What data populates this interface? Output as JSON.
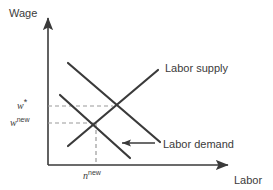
{
  "figure": {
    "type": "economics-supply-demand-diagram",
    "axes": {
      "y_label": "Wage",
      "x_label": "Labor"
    },
    "curve_labels": {
      "supply": "Labor supply",
      "demand": "Labor demand"
    },
    "tick_labels": {
      "wage_original_base": "w",
      "wage_original_sup": "*",
      "wage_new_base": "w",
      "wage_new_sup": "new",
      "labor_new_base": "n",
      "labor_new_sup": "new"
    },
    "colors": {
      "line": "#3a3a3a",
      "axis": "#3a3a3a",
      "dashed": "#9a9a9a",
      "background": "#ffffff",
      "text": "#3b3b3b"
    },
    "annotation": {
      "shift_arrow_direction": "left",
      "shift_meaning": "labor demand shifts left"
    }
  },
  "chart_data": {
    "type": "line",
    "title": "",
    "xlabel": "Labor",
    "ylabel": "Wage",
    "grid": false,
    "legend": "inline-labels",
    "axis_origin_px": [
      48,
      165
    ],
    "series": [
      {
        "name": "Labor supply",
        "style": "solid",
        "points_px": [
          [
            68,
            146
          ],
          [
            158,
            70
          ]
        ]
      },
      {
        "name": "Labor demand (original)",
        "style": "solid",
        "points_px": [
          [
            68,
            63
          ],
          [
            160,
            142
          ]
        ]
      },
      {
        "name": "Labor demand (new, shifted left)",
        "style": "solid",
        "points_px": [
          [
            60,
            95
          ],
          [
            130,
            158
          ]
        ]
      }
    ],
    "equilibria": [
      {
        "name": "original",
        "wage_label": "w*",
        "point_px": [
          113,
          106
        ]
      },
      {
        "name": "new",
        "wage_label": "w^new",
        "labor_label": "n^new",
        "point_px": [
          96,
          123
        ]
      }
    ],
    "guides": [
      {
        "kind": "dashed-horizontal",
        "from_px": [
          48,
          106
        ],
        "to_px": [
          113,
          106
        ]
      },
      {
        "kind": "dashed-horizontal",
        "from_px": [
          48,
          123
        ],
        "to_px": [
          96,
          123
        ]
      },
      {
        "kind": "dashed-vertical",
        "from_px": [
          96,
          123
        ],
        "to_px": [
          96,
          165
        ]
      }
    ],
    "annotations": [
      {
        "kind": "arrow",
        "direction": "left",
        "from_px": [
          155,
          143
        ],
        "to_px": [
          120,
          143
        ]
      }
    ]
  }
}
